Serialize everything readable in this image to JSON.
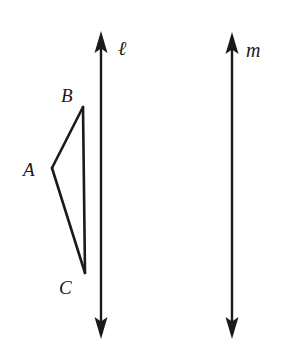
{
  "diagram": {
    "kind": "geometry-figure",
    "background_color": "#ffffff",
    "stroke_color": "#1a1a1a",
    "canvas": {
      "width": 282,
      "height": 354
    },
    "triangle": {
      "name": "triangle-abc",
      "vertices": [
        {
          "id": "A",
          "label": "A",
          "x": 52,
          "y": 168
        },
        {
          "id": "B",
          "label": "B",
          "x": 83,
          "y": 107
        },
        {
          "id": "C",
          "label": "C",
          "x": 85,
          "y": 273
        }
      ],
      "edges": [
        {
          "id": "AB",
          "from": "A",
          "to": "B"
        },
        {
          "id": "BC",
          "from": "B",
          "to": "C"
        },
        {
          "id": "CA",
          "from": "C",
          "to": "A"
        }
      ],
      "stroke_width": 2.6
    },
    "lines": [
      {
        "id": "l",
        "label": "ℓ",
        "name": "line-l",
        "x": 101,
        "y_top": 32,
        "y_bottom": 338,
        "stroke_width": 2.4,
        "arrowheads": "both"
      },
      {
        "id": "m",
        "label": "m",
        "name": "line-m",
        "x": 232,
        "y_top": 33,
        "y_bottom": 338,
        "stroke_width": 2.4,
        "arrowheads": "both"
      }
    ],
    "arrowhead": {
      "half_width": 6.5,
      "length": 21
    }
  }
}
